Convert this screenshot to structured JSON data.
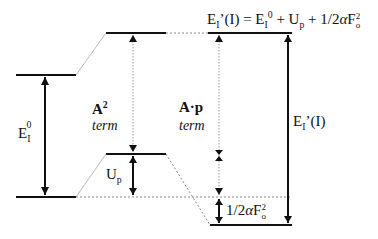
{
  "diagram": {
    "type": "energy-level-diagram",
    "levels": [
      {
        "id": "bare-excited",
        "label": "E_I^0 top"
      },
      {
        "id": "bare-ground",
        "label": "ground"
      },
      {
        "id": "a2-shifted-upper",
        "label": "A^2 upper"
      },
      {
        "id": "a2-shifted-lower",
        "label": "U_p level"
      },
      {
        "id": "dressed-upper",
        "label": "E_I'(I) upper"
      },
      {
        "id": "dressed-lower",
        "label": "dressed ground"
      }
    ],
    "labels": {
      "formula_main": "E",
      "formula_sub": "I",
      "formula_rest1": "’(I) = E",
      "formula_sub2": "I",
      "formula_sup2": "0",
      "formula_rest2": " + U",
      "formula_sub3": "p",
      "formula_rest3": " + 1/2",
      "formula_alpha": "α",
      "formula_F": "F",
      "formula_sup4": "2",
      "formula_sub4": "o",
      "e0_main": "E",
      "e0_sub": "I",
      "e0_sup": "0",
      "a2_bold": "A",
      "a2_sup": "2",
      "a2_term": "term",
      "ap_bold": "A·p",
      "ap_term": "term",
      "up_main": "U",
      "up_sub": "p",
      "ponder_pre": "1/2",
      "ponder_alpha": "α",
      "ponder_F": "F",
      "ponder_sup": "2",
      "ponder_sub": "o",
      "eprime_main": "E",
      "eprime_sub": "I",
      "eprime_rest": "’(I)"
    }
  }
}
